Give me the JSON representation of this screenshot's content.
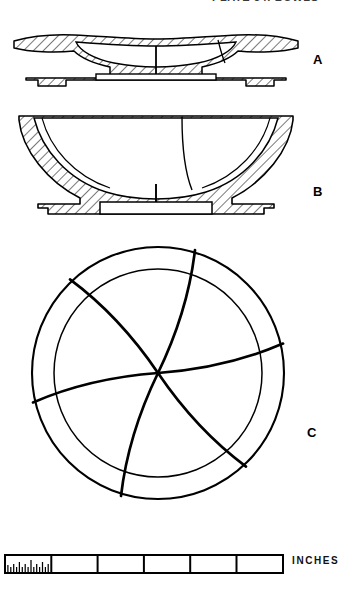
{
  "plate": {
    "title": "Ceramic vessel profiles and decorated plan",
    "background_color": "#ffffff",
    "ink_color": "#000000",
    "caption_top": "PLATE 34.  BOWLS",
    "caption_clipped": true
  },
  "figures": [
    {
      "id": "A",
      "label": "A",
      "kind": "vessel-section",
      "description": "Shallow flaring-rim plate, hatched cross-section with low ring foot"
    },
    {
      "id": "B",
      "label": "B",
      "kind": "vessel-section",
      "description": "Deep hemispherical bowl, hatched cross-section with ring foot"
    },
    {
      "id": "C",
      "label": "C",
      "kind": "plan-view",
      "description": "Plan view with concentric rim circle and six-arm curved whirl motif"
    }
  ],
  "plan_view": {
    "center_x": 158,
    "center_y": 373,
    "outer_radius": 126,
    "inner_radius": 104,
    "arm_count": 6,
    "motif": "pinwheel-whirl"
  },
  "scale": {
    "units_label": "INCHES",
    "total_units": 6,
    "major_divisions": 6,
    "minor_ticks_first_unit": 16,
    "tick_values": [
      "0",
      "1",
      "2",
      "3",
      "4",
      "5",
      "6"
    ]
  }
}
